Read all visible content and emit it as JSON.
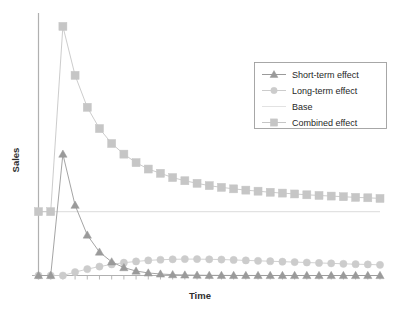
{
  "chart_data": {
    "type": "line",
    "title": "",
    "xlabel": "Time",
    "ylabel": "Sales",
    "grid": false,
    "legend_position": "top-right",
    "x_tick_labels": [],
    "y_tick_labels": [],
    "xlim": [
      0,
      28
    ],
    "ylim": [
      0,
      120
    ],
    "x": [
      0,
      1,
      2,
      3,
      4,
      5,
      6,
      7,
      8,
      9,
      10,
      11,
      12,
      13,
      14,
      15,
      16,
      17,
      18,
      19,
      20,
      21,
      22,
      23,
      24,
      25,
      26,
      27,
      28
    ],
    "series": [
      {
        "name": "Short-term effect",
        "marker": "triangle",
        "color": "#9a9a9a",
        "values": [
          0,
          0,
          57,
          33,
          19,
          11,
          6.4,
          3.7,
          2.1,
          1.2,
          0.7,
          0.4,
          0.25,
          0.15,
          0.08,
          0.05,
          0.03,
          0.02,
          0.01,
          0.006,
          0.004,
          0.002,
          0.001,
          0.001,
          0,
          0,
          0,
          0,
          0
        ]
      },
      {
        "name": "Long-term effect",
        "marker": "circle",
        "color": "#cccccc",
        "values": [
          0,
          0,
          0,
          1.6,
          3.0,
          4.2,
          5.2,
          6.0,
          6.6,
          7.1,
          7.4,
          7.6,
          7.7,
          7.7,
          7.6,
          7.5,
          7.3,
          7.1,
          6.9,
          6.7,
          6.5,
          6.3,
          6.1,
          5.9,
          5.7,
          5.5,
          5.3,
          5.2,
          5.0
        ]
      },
      {
        "name": "Base",
        "marker": "none",
        "color": "#e2e2e2",
        "values": [
          30,
          30,
          30,
          30,
          30,
          30,
          30,
          30,
          30,
          30,
          30,
          30,
          30,
          30,
          30,
          30,
          30,
          30,
          30,
          30,
          30,
          30,
          30,
          30,
          30,
          30,
          30,
          30,
          30
        ]
      },
      {
        "name": "Combined effect",
        "marker": "square",
        "color": "#c6c6c6",
        "values": [
          30,
          30,
          117,
          94,
          79,
          69,
          62,
          57,
          53,
          50,
          48,
          46,
          44.5,
          43.3,
          42.2,
          41.4,
          40.7,
          40.1,
          39.6,
          39.1,
          38.7,
          38.3,
          37.9,
          37.6,
          37.3,
          37.0,
          36.7,
          36.5,
          36.2
        ]
      }
    ]
  },
  "legend": {
    "entries": [
      {
        "label": "Short-term effect",
        "marker": "triangle",
        "color": "#9a9a9a"
      },
      {
        "label": "Long-term effect",
        "marker": "circle",
        "color": "#cccccc"
      },
      {
        "label": "Base",
        "marker": "none",
        "color": "#e2e2e2"
      },
      {
        "label": "Combined effect",
        "marker": "square",
        "color": "#c6c6c6"
      }
    ]
  },
  "axes": {
    "y_title": "Sales",
    "x_title": "Time",
    "axis_color": "#b8b8b8"
  }
}
